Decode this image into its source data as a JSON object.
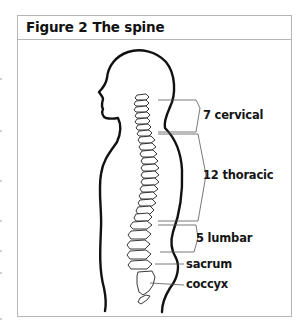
{
  "figure": {
    "number_label": "Figure 2",
    "title": "The spine"
  },
  "labels": {
    "cervical": "7 cervical",
    "thoracic": "12 thoracic",
    "lumbar": "5 lumbar",
    "sacrum": "sacrum",
    "coccyx": "coccyx"
  },
  "regions": [
    {
      "name": "cervical",
      "count": 7
    },
    {
      "name": "thoracic",
      "count": 12
    },
    {
      "name": "lumbar",
      "count": 5
    },
    {
      "name": "sacrum",
      "count": null
    },
    {
      "name": "coccyx",
      "count": null
    }
  ],
  "colors": {
    "frame_border": "#b5b5b5",
    "outline": "#111111",
    "text": "#151515"
  }
}
